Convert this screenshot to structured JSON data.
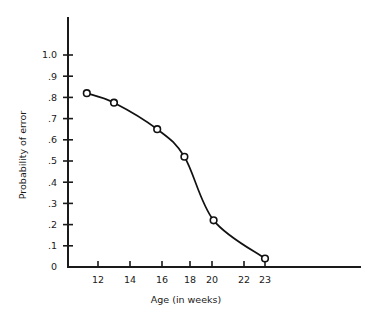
{
  "chart_data": {
    "type": "line",
    "title": "",
    "subtitle": "",
    "xlabel": "Age (in weeks)",
    "ylabel": "Probability of error",
    "grid": false,
    "legend": "none",
    "markers": "open-circle",
    "xlim": [
      10.2,
      25.5
    ],
    "ylim": [
      0,
      1.12
    ],
    "x_tick_labels": [
      "12",
      "14",
      "16",
      "18",
      "20",
      "22",
      "23"
    ],
    "x_tick_values": [
      12,
      14,
      16,
      18,
      20,
      22,
      23
    ],
    "y_tick_labels": [
      "0",
      ".1",
      ".2",
      ".3",
      ".4",
      ".5",
      ".6",
      ".7",
      ".8",
      ".9",
      "1.0"
    ],
    "y_tick_values": [
      0,
      0.1,
      0.2,
      0.3,
      0.4,
      0.5,
      0.6,
      0.7,
      0.8,
      0.9,
      1.0
    ],
    "series": [
      {
        "name": "Probability of error",
        "x": [
          11.3,
          13.0,
          15.7,
          17.6,
          20.1,
          23.0
        ],
        "values": [
          0.82,
          0.775,
          0.65,
          0.52,
          0.22,
          0.04
        ]
      }
    ]
  }
}
